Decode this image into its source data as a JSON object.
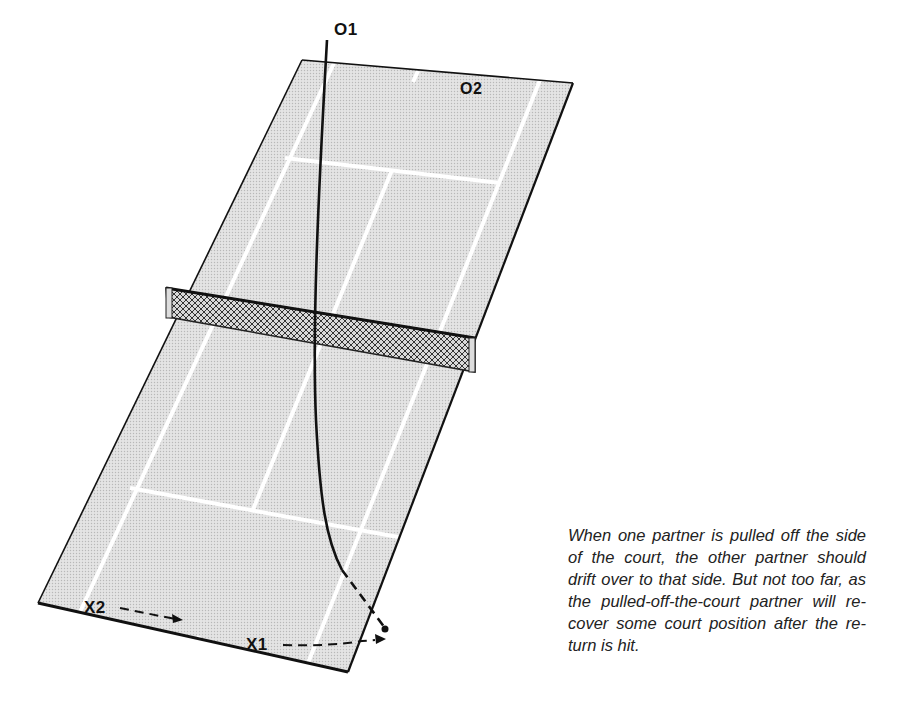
{
  "figure": {
    "type": "tennis-doubles-court-diagram",
    "colors": {
      "court_fill": "#dcdcdc",
      "court_lines": "#ffffff",
      "outline": "#111111",
      "net_fill": "#8a8a8a",
      "path": "#111111"
    },
    "players": {
      "o1": {
        "label": "O1"
      },
      "o2": {
        "label": "O2"
      },
      "x1": {
        "label": "X1"
      },
      "x2": {
        "label": "X2"
      }
    },
    "movements": [
      {
        "player": "X2",
        "style": "dashed-arrow",
        "direction": "right"
      },
      {
        "player": "X1",
        "style": "dashed-arrow",
        "direction": "right-off-court"
      },
      {
        "from": "O1",
        "style": "ball-path",
        "ends": "off-court-right-side"
      }
    ]
  },
  "caption": {
    "text": "When one partner is pulled off the side of the court, the other partner should drift over to that side. But not too far, as the pulled-off-the-court partner will re-cover some court position after the re-turn is hit."
  }
}
